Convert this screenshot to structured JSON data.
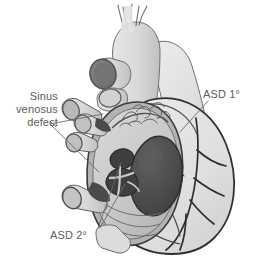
{
  "figure": {
    "background_color": "#ffffff"
  },
  "labels": {
    "sinus_venosus": "Sinus\nvenosus\ndefect",
    "asd_primum": "ASD 1°",
    "asd_secundum": "ASD 2°"
  },
  "palette": {
    "outline": "#3b3b3b",
    "ventricle_fill": "#e3e3e3",
    "atrium_fill": "#cfcfcf",
    "atrium_wall": "#b5b5b5",
    "vessel_fill": "#dcdcdc",
    "lumen_dark": "#6f6f6f",
    "defect_dark": "#3f3f3f",
    "valve_oval": "#4a4a4a",
    "label_text": "#5c5c5c",
    "leader_line": "#6b6b6b"
  },
  "structures": [
    {
      "name": "aortic-arch",
      "description": "Aortic arch with three brachiocephalic branch vessels at superior margin"
    },
    {
      "name": "pulmonary-trunk",
      "description": "Pulmonary trunk passing to the left of the aorta"
    },
    {
      "name": "superior-vena-cava-stump",
      "description": "Cut superior vena cava with open elliptical lumen"
    },
    {
      "name": "pulmonary-vein-stumps",
      "description": "Cut pulmonary vein stumps along the left border of the right atrium"
    },
    {
      "name": "inferior-vena-cava-stump",
      "description": "Cut inferior vena cava entering the right atrium inferiorly"
    },
    {
      "name": "right-atrium-opened",
      "description": "Opened right atrium exposing the interatrial septum"
    },
    {
      "name": "pectinate-muscles",
      "description": "Pectinate muscle ridges on the anterior atrial wall"
    },
    {
      "name": "tricuspid-orifice",
      "description": "Large dark oval orifice on the right of the opened atrium"
    },
    {
      "name": "asd-secundum-openings",
      "description": "Fenestrated secundum defects in the region of the fossa ovalis"
    },
    {
      "name": "right-ventricle",
      "description": "Right ventricle forming the inferior right contour"
    },
    {
      "name": "coronary-arteries",
      "description": "Branching coronary vessels over the ventricular surface"
    }
  ],
  "leaders": {
    "sinus_venosus_targets": 2,
    "asd_primum_targets": 1,
    "asd_secundum_targets": 2
  }
}
